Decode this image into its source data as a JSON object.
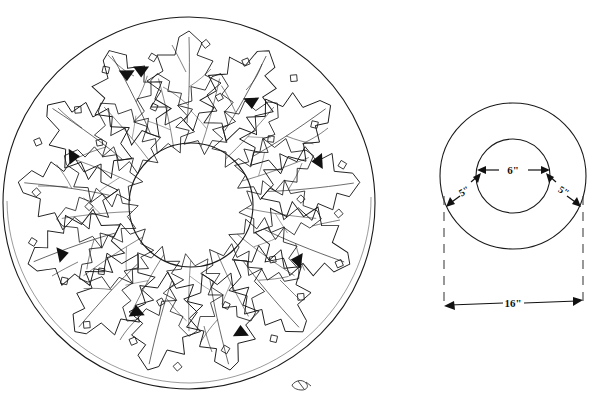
{
  "document": {
    "title": "Holly Wreath Pattern Diagram",
    "background_color": "#ffffff",
    "ink_color": "#1a1a1a",
    "width": 594,
    "height": 417
  },
  "figures": [
    {
      "id": "wreath-illustration",
      "name": "Holly wreath pattern drawing",
      "description": "Hand-drawn circular holly wreath of overlapping spiked leaves with small diamond-shaped berries and solid arrow tips, drawn between an outer circle and an open center circle.",
      "outer_circle": {
        "cx": 189,
        "cy": 203,
        "r": 186
      },
      "inner_circle": {
        "cx": 191,
        "cy": 205,
        "r": 62
      },
      "leaf_ring_outer_radius": 178,
      "leaf_ring_inner_radius": 66,
      "leaf_count": 26,
      "berry_count": 30,
      "solid_tip_count": 9
    },
    {
      "id": "dimension-diagram",
      "name": "Dimension diagram",
      "description": "Two concentric circles with dimension arrows labelling the inner diameter, the border width on each side, and the total outer diameter.",
      "outer_circle": {
        "cx": 513,
        "cy": 176,
        "r": 73
      },
      "inner_circle": {
        "cx": 513,
        "cy": 176,
        "r": 37
      }
    }
  ],
  "dimensions": {
    "inner_diameter": {
      "label": "6\"",
      "name": "inner-diameter-dimension",
      "x": 513,
      "y": 173
    },
    "border_left": {
      "label": "5\"",
      "name": "left-border-dimension",
      "x": 466,
      "y": 192
    },
    "border_right": {
      "label": "5\"",
      "name": "right-border-dimension",
      "x": 562,
      "y": 192
    },
    "outer_diameter": {
      "label": "16\"",
      "name": "outer-diameter-dimension",
      "x": 513,
      "y": 303
    }
  },
  "extension_lines": {
    "left_x": 444,
    "right_x": 583,
    "top_y": 198,
    "bottom_y": 308,
    "style": "dashed"
  },
  "artist_mark": {
    "name": "artist-signature-mark",
    "x": 300,
    "y": 385,
    "description": "small scribbled monogram near lower-right edge of wreath"
  }
}
